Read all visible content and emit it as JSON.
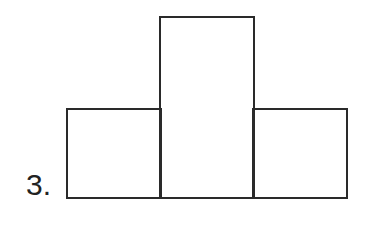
{
  "problem": {
    "number_label": "3.",
    "figure": {
      "description": "Three rectangles side by side; the middle one is taller",
      "shapes": [
        {
          "name": "left-rectangle",
          "relative_height": 1
        },
        {
          "name": "middle-rectangle",
          "relative_height": 2
        },
        {
          "name": "right-rectangle",
          "relative_height": 1
        }
      ],
      "stroke_color": "#2a2a2a"
    }
  }
}
